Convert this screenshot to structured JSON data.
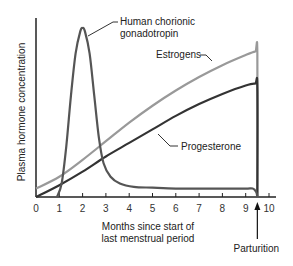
{
  "chart_data": {
    "type": "line",
    "title": "",
    "xlabel": [
      "Months since start of",
      "last menstrual period"
    ],
    "ylabel": "Plasma hormone concentration",
    "xlim": [
      0,
      10
    ],
    "ylim": [
      0,
      1
    ],
    "xticks": [
      0,
      1,
      2,
      3,
      4,
      5,
      6,
      7,
      8,
      9,
      10
    ],
    "xtick_labels": [
      "0",
      "1",
      "2",
      "3",
      "4",
      "5",
      "6",
      "7",
      "8",
      "9",
      "10"
    ],
    "grid": false,
    "legend": "none (inline callout labels)",
    "series": [
      {
        "name": "Human chorionic gonadotropin",
        "label_lines": [
          "Human chorionic",
          "gonadotropin"
        ],
        "color": "#555555",
        "x": [
          0.9,
          1.1,
          1.3,
          1.5,
          1.7,
          1.9,
          2.0,
          2.1,
          2.3,
          2.5,
          2.7,
          2.9,
          3.2,
          3.6,
          4.2,
          5.0,
          6.0,
          7.0,
          8.0,
          9.0,
          9.3,
          9.45,
          9.5
        ],
        "y": [
          0.0,
          0.08,
          0.3,
          0.6,
          0.85,
          0.98,
          1.0,
          0.98,
          0.85,
          0.6,
          0.35,
          0.2,
          0.12,
          0.08,
          0.06,
          0.055,
          0.05,
          0.05,
          0.05,
          0.05,
          0.05,
          0.03,
          0.0
        ]
      },
      {
        "name": "Estrogens",
        "label_lines": [
          "Estrogens"
        ],
        "color": "#999999",
        "x": [
          0,
          1,
          2,
          3,
          4,
          5,
          6,
          7,
          8,
          9,
          9.4,
          9.5,
          9.5
        ],
        "y": [
          0.05,
          0.12,
          0.22,
          0.33,
          0.44,
          0.54,
          0.63,
          0.71,
          0.78,
          0.84,
          0.86,
          0.85,
          0.0
        ]
      },
      {
        "name": "Progesterone",
        "label_lines": [
          "Progesterone"
        ],
        "color": "#333333",
        "x": [
          0,
          1,
          2,
          3,
          4,
          5,
          6,
          7,
          8,
          9,
          9.4,
          9.5,
          9.5
        ],
        "y": [
          0.0,
          0.07,
          0.15,
          0.24,
          0.32,
          0.4,
          0.48,
          0.55,
          0.61,
          0.66,
          0.67,
          0.65,
          0.0
        ]
      }
    ],
    "annotations": [
      {
        "text": "Parturition",
        "x": 9.5,
        "type": "arrow-up"
      }
    ]
  }
}
